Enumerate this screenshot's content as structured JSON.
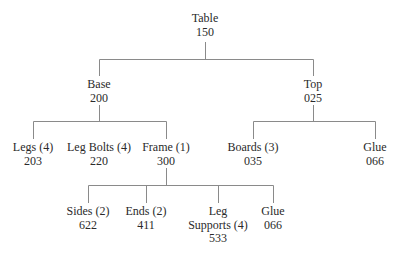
{
  "diagram": {
    "type": "product-structure-tree",
    "line_color": "#8a8a8a",
    "root": {
      "label": "Table",
      "code": "150",
      "children": [
        {
          "label": "Base",
          "code": "200",
          "children": [
            {
              "label": "Legs (4)",
              "code": "203"
            },
            {
              "label": "Leg Bolts (4)",
              "code": "220"
            },
            {
              "label": "Frame (1)",
              "code": "300",
              "children": [
                {
                  "label": "Sides (2)",
                  "code": "622"
                },
                {
                  "label": "Ends (2)",
                  "code": "411"
                },
                {
                  "label_line1": "Leg",
                  "label_line2": "Supports (4)",
                  "code": "533"
                },
                {
                  "label": "Glue",
                  "code": "066"
                }
              ]
            }
          ]
        },
        {
          "label": "Top",
          "code": "025",
          "children": [
            {
              "label": "Boards (3)",
              "code": "035"
            },
            {
              "label": "Glue",
              "code": "066"
            }
          ]
        }
      ]
    }
  }
}
